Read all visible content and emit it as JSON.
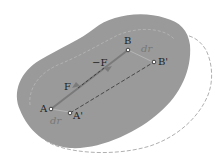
{
  "diagram": {
    "labels": {
      "A": "A",
      "B": "B",
      "A_prime": "A'",
      "B_prime": "B'",
      "F": "F",
      "neg_F": "−F",
      "dr_A": "dr",
      "dr_B": "dr"
    },
    "colors": {
      "body_fill": "#9a9a9a",
      "body_outline_dashed": "#b0b0b0",
      "force_arrow": "#7a7a7a",
      "line_dashed": "#333333",
      "label_text": "#222222",
      "dr_text": "#777777"
    }
  }
}
